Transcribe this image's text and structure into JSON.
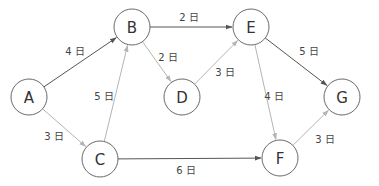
{
  "diagram": {
    "type": "directed-graph",
    "colors": {
      "critical": "#555555",
      "normal": "#b5b5b5",
      "node_stroke": "#6a6a6a"
    },
    "nodes": [
      {
        "id": "A",
        "label": "A",
        "x": 29,
        "y": 97
      },
      {
        "id": "B",
        "label": "B",
        "x": 132,
        "y": 27
      },
      {
        "id": "C",
        "label": "C",
        "x": 100,
        "y": 159
      },
      {
        "id": "D",
        "label": "D",
        "x": 182,
        "y": 97
      },
      {
        "id": "E",
        "label": "E",
        "x": 251,
        "y": 27
      },
      {
        "id": "F",
        "label": "F",
        "x": 280,
        "y": 158
      },
      {
        "id": "G",
        "label": "G",
        "x": 342,
        "y": 97
      }
    ],
    "edges": [
      {
        "from": "A",
        "to": "B",
        "label": "4 日",
        "critical": true,
        "lx": 75,
        "ly": 51
      },
      {
        "from": "A",
        "to": "C",
        "label": "3 日",
        "critical": false,
        "lx": 54,
        "ly": 136
      },
      {
        "from": "C",
        "to": "B",
        "label": "5 日",
        "critical": false,
        "lx": 104,
        "ly": 96
      },
      {
        "from": "B",
        "to": "E",
        "label": "2 日",
        "critical": true,
        "lx": 189,
        "ly": 17
      },
      {
        "from": "B",
        "to": "D",
        "label": "2 日",
        "critical": false,
        "lx": 168,
        "ly": 57
      },
      {
        "from": "D",
        "to": "E",
        "label": "3 日",
        "critical": false,
        "lx": 225,
        "ly": 72
      },
      {
        "from": "E",
        "to": "G",
        "label": "5 日",
        "critical": true,
        "lx": 309,
        "ly": 51
      },
      {
        "from": "E",
        "to": "F",
        "label": "4 日",
        "critical": false,
        "lx": 274,
        "ly": 96
      },
      {
        "from": "C",
        "to": "F",
        "label": "6 日",
        "critical": true,
        "lx": 186,
        "ly": 170
      },
      {
        "from": "F",
        "to": "G",
        "label": "3 日",
        "critical": false,
        "lx": 325,
        "ly": 139
      }
    ]
  }
}
